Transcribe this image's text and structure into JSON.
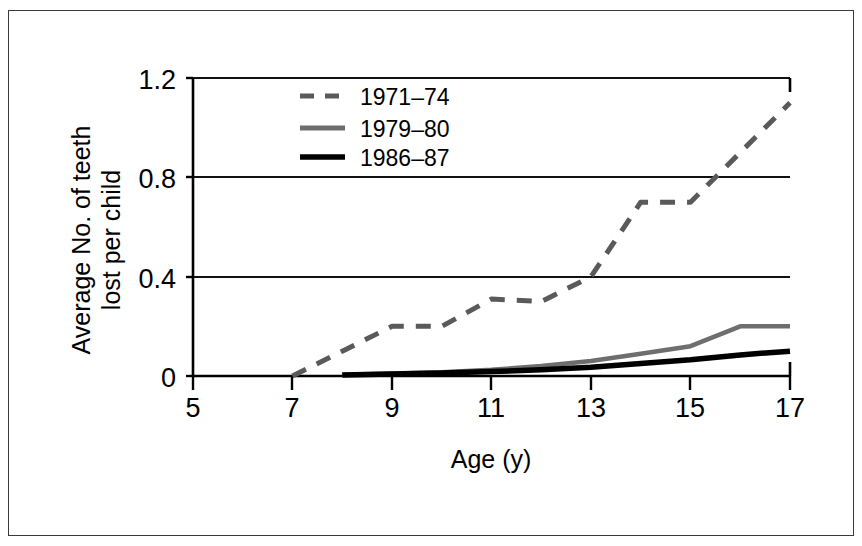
{
  "chart_data": {
    "type": "line",
    "title": "",
    "xlabel": "Age (y)",
    "ylabel": "Average No. of teeth lost per child",
    "ylabel_line1": "Average No. of teeth",
    "ylabel_line2": "lost per child",
    "xlim": [
      5,
      17
    ],
    "ylim": [
      0,
      1.2
    ],
    "xticks": [
      5,
      7,
      9,
      11,
      13,
      15,
      17
    ],
    "xtick_labels": [
      "5",
      "7",
      "9",
      "11",
      "13",
      "15",
      "17"
    ],
    "yticks": [
      0,
      0.4,
      0.8,
      1.2
    ],
    "ytick_labels": [
      "0",
      "0.4",
      "0.8",
      "1.2"
    ],
    "grid": "horizontal",
    "legend_position": "top-center",
    "series": [
      {
        "name": "1971–74",
        "style": "dashed",
        "color": "#5a5a5a",
        "x": [
          7,
          8,
          9,
          10,
          11,
          12,
          13,
          14,
          15,
          16,
          17
        ],
        "values": [
          0.0,
          0.1,
          0.2,
          0.2,
          0.31,
          0.3,
          0.4,
          0.7,
          0.7,
          0.9,
          1.1
        ]
      },
      {
        "name": "1979–80",
        "style": "solid",
        "color": "#6e6e6e",
        "x": [
          8,
          9,
          10,
          11,
          12,
          13,
          14,
          15,
          16,
          17
        ],
        "values": [
          0.005,
          0.01,
          0.015,
          0.025,
          0.04,
          0.06,
          0.09,
          0.12,
          0.2,
          0.2
        ]
      },
      {
        "name": "1986–87",
        "style": "solid",
        "color": "#000000",
        "x": [
          8,
          9,
          10,
          11,
          12,
          13,
          14,
          15,
          16,
          17
        ],
        "values": [
          0.004,
          0.008,
          0.012,
          0.018,
          0.025,
          0.035,
          0.05,
          0.065,
          0.085,
          0.1
        ]
      }
    ]
  },
  "legend": {
    "entries": [
      {
        "label": "1971–74"
      },
      {
        "label": "1979–80"
      },
      {
        "label": "1986–87"
      }
    ]
  },
  "colors": {
    "series_1971": "#5a5a5a",
    "series_1979": "#6e6e6e",
    "series_1986": "#000000",
    "axis": "#000000",
    "frame": "#3a3a3a"
  }
}
